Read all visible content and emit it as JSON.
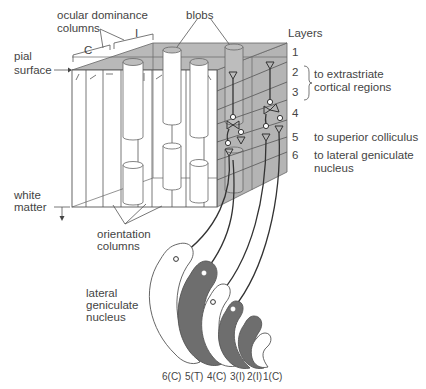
{
  "diagram": {
    "type": "primary visual cortex (V1) architecture block with LGN projection",
    "colors": {
      "cortex_surface_gray": "#b9b9b9",
      "lgn_dark_layer": "#6e6e6e",
      "line": "#555555",
      "text": "#444444"
    }
  },
  "labels": {
    "ocular_dominance_line1": "ocular dominance",
    "ocular_dominance_line2": "columns",
    "contralateral": "C",
    "ipsilateral": "I",
    "blobs": "blobs",
    "pial_line1": "pial",
    "pial_line2": "surface",
    "white_line1": "white",
    "white_line2": "matter",
    "orientation_line1": "orientation",
    "orientation_line2": "columns",
    "lgn_line1": "lateral",
    "lgn_line2": "geniculate",
    "lgn_line3": "nucleus"
  },
  "layers": {
    "title": "Layers",
    "items": [
      {
        "number": "1",
        "target": ""
      },
      {
        "number": "2",
        "target": ""
      },
      {
        "number": "3",
        "target": ""
      },
      {
        "number": "4",
        "target": ""
      },
      {
        "number": "5",
        "target": "to superior colliculus"
      },
      {
        "number": "6",
        "target": "to lateral geniculate",
        "target2": "nucleus"
      }
    ],
    "layers_2_3_target_line1": "to extrastriate",
    "layers_2_3_target_line2": "cortical regions"
  },
  "lgn_layers": {
    "items": [
      {
        "label": "6(C)",
        "shade": "white"
      },
      {
        "label": "5(T)",
        "shade": "dark"
      },
      {
        "label": "4(C)",
        "shade": "white"
      },
      {
        "label": "3(I)",
        "shade": "dark"
      },
      {
        "label": "2(I)",
        "shade": "dark"
      },
      {
        "label": "1(C)",
        "shade": "white"
      }
    ]
  }
}
